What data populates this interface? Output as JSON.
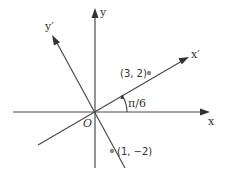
{
  "diagram": {
    "axes": {
      "x_label": "x",
      "y_label": "y",
      "x_prime_label": "x′",
      "y_prime_label": "y′",
      "origin_label": "O"
    },
    "rotation_angle_label": "π/6",
    "rotation_angle_radians": 0.5236,
    "points": [
      {
        "label": "(3, 2)",
        "x": 3,
        "y": 2
      },
      {
        "label": "(1, −2)",
        "x": 1,
        "y": -2
      }
    ],
    "colors": {
      "axis": "#4a4a4a",
      "point": "#8a8a8a",
      "text": "#333333"
    }
  }
}
